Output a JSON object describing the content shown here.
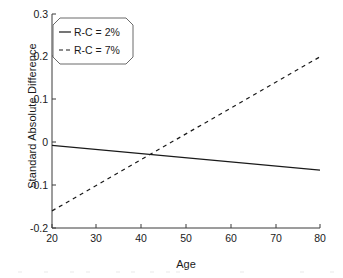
{
  "chart_data": {
    "type": "line",
    "title": "",
    "xlabel": "Age",
    "ylabel": "Standard Absolute Difference",
    "xlim": [
      20,
      80
    ],
    "ylim": [
      -0.2,
      0.3
    ],
    "xticks": [
      "20",
      "30",
      "40",
      "50",
      "60",
      "70",
      "80"
    ],
    "yticks": [
      "0.3",
      "0.2",
      "0.1",
      "0",
      "-0.1",
      "-0.2"
    ],
    "grid": false,
    "legend_position": "upper-left-inside",
    "series": [
      {
        "name": "R-C = 2%",
        "style": "solid",
        "color": "#1a1a1a",
        "x": [
          20,
          80
        ],
        "values": [
          -0.007,
          -0.065
        ]
      },
      {
        "name": "R-C = 7%",
        "style": "dashed",
        "color": "#1a1a1a",
        "x": [
          20,
          80
        ],
        "values": [
          -0.16,
          0.2
        ]
      }
    ],
    "annotations": []
  },
  "legend": {
    "items": [
      {
        "label": "R-C = 2%"
      },
      {
        "label": "R-C = 7%"
      }
    ]
  }
}
